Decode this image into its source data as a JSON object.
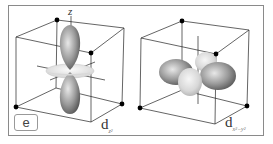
{
  "figure": {
    "panel_label": "e",
    "axis_label": "z",
    "orbitals": [
      {
        "name": "d_z2",
        "label_main": "d",
        "label_sub": "z²"
      },
      {
        "name": "d_x2-y2",
        "label_main": "d",
        "label_sub": "x²−y²"
      }
    ]
  },
  "colors": {
    "frame": "#8a8a8a",
    "cube_edge": "#222222",
    "vertex_dot": "#000000",
    "lobe_dark": "#6e6e6e",
    "lobe_light": "#d6d6d6",
    "torus": "#e2e2e2"
  }
}
